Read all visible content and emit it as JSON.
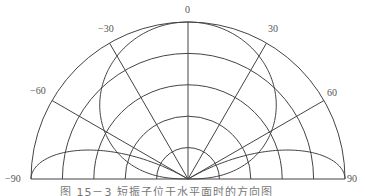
{
  "figure": {
    "type": "polar-radiation-pattern",
    "caption": "图 15－3 短振子位于水平面时的方向图",
    "center": [
      188,
      179
    ],
    "radius": 157,
    "ring_count": 5,
    "stroke_color": "#444444",
    "angle_labels": [
      {
        "text": "0",
        "angle": 0
      },
      {
        "text": "−30",
        "angle": -30
      },
      {
        "text": "30",
        "angle": 30
      },
      {
        "text": "−60",
        "angle": -60
      },
      {
        "text": "60",
        "angle": 60
      },
      {
        "text": "−90",
        "angle": -90
      },
      {
        "text": "90",
        "angle": 90
      }
    ],
    "radial_lines_deg": [
      -90,
      -60,
      -30,
      0,
      30,
      60,
      90
    ],
    "main_lobe": {
      "formula": "r = R * cos(theta)^0.7",
      "max_at_deg": 0
    },
    "side_lobes": [
      {
        "max_at_deg": -90,
        "width_deg": 30
      },
      {
        "max_at_deg": 90,
        "width_deg": 30
      }
    ]
  }
}
